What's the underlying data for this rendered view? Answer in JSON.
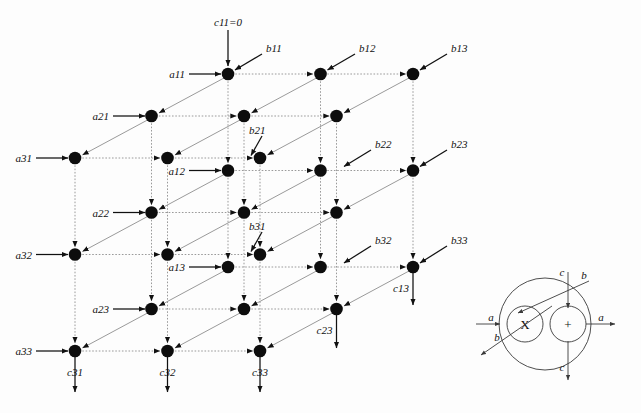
{
  "figure": {
    "type": "systolic-array-diagram",
    "title": "",
    "grid": {
      "rows": 3,
      "cols": 3,
      "layers": 3
    },
    "colors": {
      "node": "#0d0d0d",
      "dotted_edge": "#9a9a9a",
      "diagonal_edge": "#9a9a9a",
      "io_arrow": "#111111",
      "legend_stroke": "#3a3a3a",
      "background": "#fdfdfd"
    }
  },
  "labels": {
    "c_init": "c11=0",
    "a_inputs": [
      {
        "id": "a11",
        "text": "a11"
      },
      {
        "id": "a21",
        "text": "a21"
      },
      {
        "id": "a31",
        "text": "a31"
      },
      {
        "id": "a12",
        "text": "a12"
      },
      {
        "id": "a22",
        "text": "a22"
      },
      {
        "id": "a32",
        "text": "a32"
      },
      {
        "id": "a13",
        "text": "a13"
      },
      {
        "id": "a23",
        "text": "a23"
      },
      {
        "id": "a33",
        "text": "a33"
      }
    ],
    "b_inputs": [
      {
        "id": "b11",
        "text": "b11"
      },
      {
        "id": "b12",
        "text": "b12"
      },
      {
        "id": "b13",
        "text": "b13"
      },
      {
        "id": "b21",
        "text": "b21"
      },
      {
        "id": "b22",
        "text": "b22"
      },
      {
        "id": "b23",
        "text": "b23"
      },
      {
        "id": "b31",
        "text": "b31"
      },
      {
        "id": "b32",
        "text": "b32"
      },
      {
        "id": "b33",
        "text": "b33"
      }
    ],
    "c_outputs": [
      {
        "id": "c31",
        "text": "c31"
      },
      {
        "id": "c32",
        "text": "c32"
      },
      {
        "id": "c33",
        "text": "c33"
      },
      {
        "id": "c13",
        "text": "c13"
      },
      {
        "id": "c23",
        "text": "c23"
      }
    ]
  },
  "legend": {
    "multiplier_symbol": "X",
    "adder_symbol": "+",
    "ports": [
      {
        "id": "a-in",
        "text": "a"
      },
      {
        "id": "a-out",
        "text": "a"
      },
      {
        "id": "b-in",
        "text": "b"
      },
      {
        "id": "b-out",
        "text": "b"
      },
      {
        "id": "c-in",
        "text": "c"
      },
      {
        "id": "c-out",
        "text": "c"
      }
    ]
  }
}
